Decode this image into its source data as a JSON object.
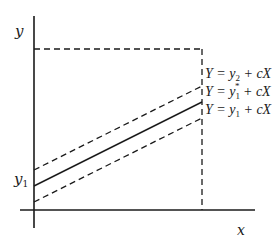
{
  "axes": {
    "x_label": "x",
    "y_label": "y",
    "y_tick_label": "y",
    "y_tick_subscript": "1"
  },
  "lines": [
    {
      "id": "upper",
      "style": "dashed",
      "label": {
        "lhs": "Y = y",
        "sub": "2",
        "sup": "",
        "rhs": " + cX"
      }
    },
    {
      "id": "middle",
      "style": "solid",
      "label": {
        "lhs": "Y = y",
        "sub": "1",
        "sup": "*",
        "rhs": " + cX"
      }
    },
    {
      "id": "lower",
      "style": "dashed",
      "label": {
        "lhs": "Y = y",
        "sub": "1",
        "sup": "",
        "rhs": " + cX"
      }
    }
  ],
  "colors": {
    "ink": "#1a1a1a",
    "background": "#ffffff"
  }
}
